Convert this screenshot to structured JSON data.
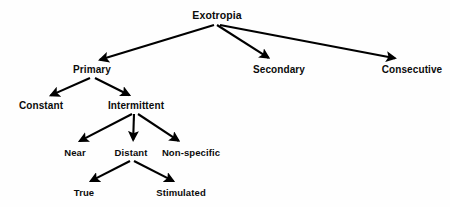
{
  "diagram": {
    "type": "hierarchy-tree",
    "background_color": "#fefefe",
    "text_color": "#0b0b0b",
    "edge_color": "#000000",
    "nodes": [
      {
        "id": "exotropia",
        "label": "Exotropia",
        "level": 0,
        "x": 217,
        "y": 15
      },
      {
        "id": "primary",
        "label": "Primary",
        "level": 1,
        "x": 92,
        "y": 70
      },
      {
        "id": "secondary",
        "label": "Secondary",
        "level": 1,
        "x": 279,
        "y": 70
      },
      {
        "id": "consecutive",
        "label": "Consecutive",
        "level": 1,
        "x": 412,
        "y": 70
      },
      {
        "id": "constant",
        "label": "Constant",
        "level": 2,
        "x": 41,
        "y": 106
      },
      {
        "id": "intermittent",
        "label": "Intermittent",
        "level": 2,
        "x": 136,
        "y": 106
      },
      {
        "id": "near",
        "label": "Near",
        "level": 3,
        "x": 75,
        "y": 153
      },
      {
        "id": "distant",
        "label": "Distant",
        "level": 3,
        "x": 131,
        "y": 153
      },
      {
        "id": "nonspecific",
        "label": "Non-specific",
        "level": 3,
        "x": 191,
        "y": 153
      },
      {
        "id": "true",
        "label": "True",
        "level": 4,
        "x": 84,
        "y": 193
      },
      {
        "id": "stimulated",
        "label": "Stimulated",
        "level": 4,
        "x": 181,
        "y": 193
      }
    ],
    "edges": [
      {
        "id": "exotropia-primary",
        "from": "exotropia",
        "to": "primary",
        "x1": 214,
        "y1": 25,
        "x2": 96,
        "y2": 61
      },
      {
        "id": "exotropia-secondary",
        "from": "exotropia",
        "to": "secondary",
        "x1": 217,
        "y1": 25,
        "x2": 272,
        "y2": 60
      },
      {
        "id": "exotropia-consecutive",
        "from": "exotropia",
        "to": "consecutive",
        "x1": 220,
        "y1": 25,
        "x2": 399,
        "y2": 59
      },
      {
        "id": "primary-constant",
        "from": "primary",
        "to": "constant",
        "x1": 90,
        "y1": 78,
        "x2": 47,
        "y2": 97
      },
      {
        "id": "primary-intermittent",
        "from": "primary",
        "to": "intermittent",
        "x1": 95,
        "y1": 78,
        "x2": 133,
        "y2": 97
      },
      {
        "id": "intermittent-near",
        "from": "intermittent",
        "to": "near",
        "x1": 132,
        "y1": 114,
        "x2": 76,
        "y2": 143
      },
      {
        "id": "intermittent-distant",
        "from": "intermittent",
        "to": "distant",
        "x1": 134,
        "y1": 114,
        "x2": 133,
        "y2": 144
      },
      {
        "id": "intermittent-nonspecific",
        "from": "intermittent",
        "to": "nonspecific",
        "x1": 138,
        "y1": 114,
        "x2": 182,
        "y2": 143
      },
      {
        "id": "distant-true",
        "from": "distant",
        "to": "true",
        "x1": 130,
        "y1": 161,
        "x2": 87,
        "y2": 183
      },
      {
        "id": "distant-stimulated",
        "from": "distant",
        "to": "stimulated",
        "x1": 134,
        "y1": 161,
        "x2": 177,
        "y2": 183
      }
    ]
  }
}
